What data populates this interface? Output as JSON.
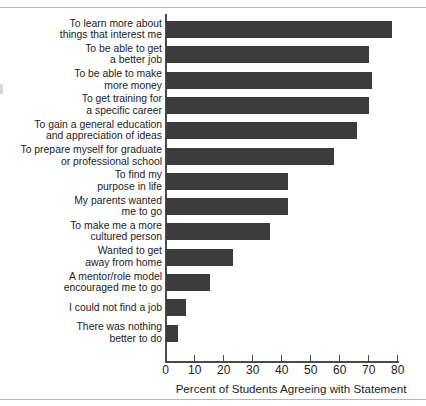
{
  "chart_data": {
    "type": "bar",
    "orientation": "horizontal",
    "title": "",
    "xlabel": "Percent of Students Agreeing with Statement",
    "ylabel": "",
    "xlim": [
      0,
      80
    ],
    "xticks": [
      0,
      10,
      20,
      30,
      40,
      50,
      60,
      70,
      80
    ],
    "grid": false,
    "legend": null,
    "bar_color": "#3c3c3c",
    "categories": [
      "To learn more about\nthings that interest me",
      "To be able to get\na better job",
      "To be able to make\nmore money",
      "To get training for\na specific career",
      "To gain a general education\nand appreciation of ideas",
      "To prepare myself for graduate\nor professional school",
      "To find my\npurpose in life",
      "My parents wanted\nme to go",
      "To make me a more\ncultured person",
      "Wanted to get\naway from home",
      "A mentor/role model\nencouraged me to go",
      "I could not find a job",
      "There was nothing\nbetter to do"
    ],
    "values": [
      78,
      70,
      71,
      70,
      66,
      58,
      42,
      42,
      36,
      23,
      15,
      7,
      4
    ]
  }
}
